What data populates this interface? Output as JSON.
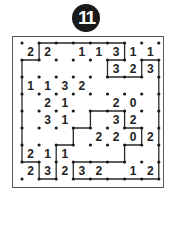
{
  "puzzle": {
    "number": "11",
    "type": "slitherlink",
    "rows": 8,
    "cols": 8,
    "clues": [
      [
        "2",
        "2",
        "",
        "1",
        "1",
        "3",
        "1",
        "1"
      ],
      [
        "",
        "",
        "",
        "",
        "",
        "3",
        "2",
        "3"
      ],
      [
        "1",
        "1",
        "3",
        "2",
        "",
        "",
        "",
        ""
      ],
      [
        "",
        "2",
        "1",
        "",
        "",
        "2",
        "0",
        ""
      ],
      [
        "",
        "3",
        "1",
        "",
        "",
        "3",
        "2",
        ""
      ],
      [
        "",
        "",
        "",
        "",
        "2",
        "2",
        "0",
        "2"
      ],
      [
        "2",
        "1",
        "1",
        "",
        "",
        "",
        "",
        ""
      ],
      [
        "2",
        "3",
        "2",
        "3",
        "2",
        "",
        "1",
        "2"
      ]
    ],
    "loop": [
      [
        1,
        0
      ],
      [
        6,
        0
      ],
      [
        6,
        1
      ],
      [
        5,
        1
      ],
      [
        5,
        2
      ],
      [
        7,
        2
      ],
      [
        7,
        1
      ],
      [
        8,
        1
      ],
      [
        8,
        8
      ],
      [
        3,
        8
      ],
      [
        3,
        7
      ],
      [
        6,
        7
      ],
      [
        6,
        6
      ],
      [
        7,
        6
      ],
      [
        7,
        5
      ],
      [
        6,
        5
      ],
      [
        6,
        4
      ],
      [
        4,
        4
      ],
      [
        4,
        5
      ],
      [
        3,
        5
      ],
      [
        3,
        6
      ],
      [
        2,
        6
      ],
      [
        2,
        8
      ],
      [
        1,
        8
      ],
      [
        1,
        7
      ],
      [
        0,
        7
      ],
      [
        0,
        1
      ],
      [
        1,
        1
      ]
    ],
    "colors": {
      "line": "#2a2a2a",
      "dot": "#1a1a1a",
      "badge": "#1a1a1a"
    }
  }
}
